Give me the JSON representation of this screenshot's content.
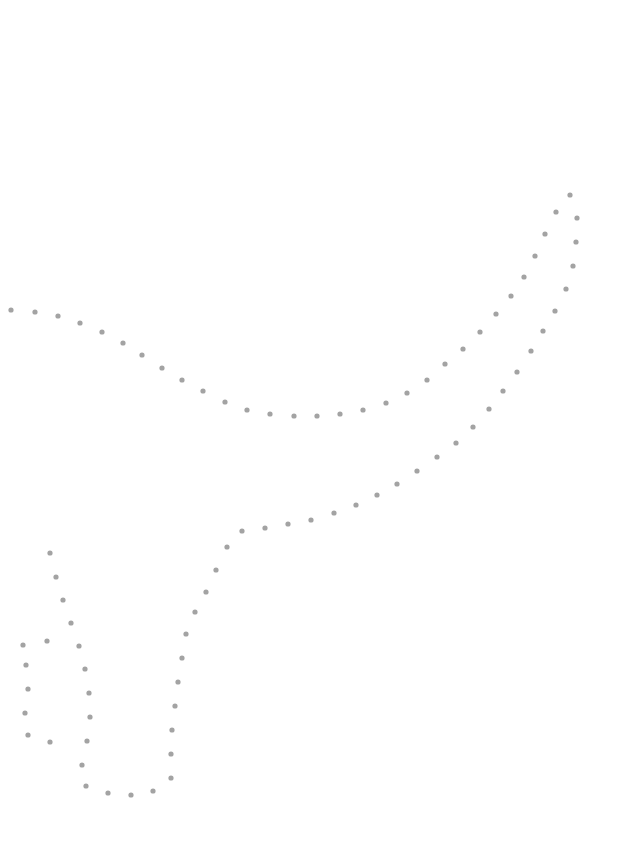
{
  "page": {
    "type": "connect-the-dots worksheet",
    "colors": {
      "background": "#ffffff",
      "dot": "#a3a3a3"
    }
  },
  "dot_groups": [
    {
      "name": "main-outline",
      "points": [
        [
          11,
          310
        ],
        [
          35,
          312
        ],
        [
          58,
          316
        ],
        [
          80,
          323
        ],
        [
          102,
          332
        ],
        [
          123,
          343
        ],
        [
          142,
          355
        ],
        [
          162,
          368
        ],
        [
          182,
          380
        ],
        [
          203,
          391
        ],
        [
          225,
          402
        ],
        [
          247,
          410
        ],
        [
          270,
          414
        ],
        [
          294,
          416
        ],
        [
          317,
          416
        ],
        [
          340,
          414
        ],
        [
          363,
          410
        ],
        [
          386,
          403
        ],
        [
          407,
          393
        ],
        [
          427,
          380
        ],
        [
          445,
          364
        ],
        [
          463,
          349
        ],
        [
          480,
          332
        ],
        [
          496,
          314
        ],
        [
          511,
          296
        ],
        [
          524,
          277
        ],
        [
          535,
          256
        ],
        [
          545,
          234
        ],
        [
          556,
          212
        ],
        [
          570,
          195
        ],
        [
          577,
          218
        ],
        [
          576,
          242
        ],
        [
          573,
          266
        ],
        [
          566,
          289
        ],
        [
          555,
          311
        ],
        [
          543,
          331
        ],
        [
          531,
          351
        ],
        [
          517,
          372
        ],
        [
          503,
          391
        ],
        [
          489,
          409
        ],
        [
          473,
          427
        ],
        [
          456,
          443
        ],
        [
          437,
          457
        ],
        [
          417,
          471
        ],
        [
          397,
          484
        ],
        [
          377,
          495
        ],
        [
          356,
          505
        ],
        [
          334,
          513
        ],
        [
          311,
          520
        ],
        [
          288,
          524
        ],
        [
          265,
          528
        ],
        [
          242,
          531
        ],
        [
          227,
          547
        ],
        [
          216,
          570
        ],
        [
          206,
          592
        ],
        [
          195,
          612
        ],
        [
          186,
          634
        ],
        [
          182,
          658
        ],
        [
          178,
          682
        ],
        [
          175,
          706
        ],
        [
          172,
          730
        ],
        [
          171,
          754
        ],
        [
          171,
          778
        ],
        [
          153,
          791
        ],
        [
          131,
          795
        ],
        [
          108,
          793
        ],
        [
          86,
          786
        ],
        [
          82,
          765
        ],
        [
          87,
          741
        ],
        [
          90,
          717
        ],
        [
          89,
          693
        ],
        [
          85,
          669
        ],
        [
          79,
          646
        ],
        [
          71,
          623
        ],
        [
          63,
          600
        ],
        [
          56,
          577
        ],
        [
          50,
          553
        ]
      ]
    },
    {
      "name": "left-detail",
      "points": [
        [
          47,
          641
        ],
        [
          23,
          645
        ],
        [
          26,
          665
        ],
        [
          28,
          689
        ],
        [
          25,
          713
        ],
        [
          28,
          735
        ],
        [
          50,
          742
        ]
      ]
    }
  ]
}
